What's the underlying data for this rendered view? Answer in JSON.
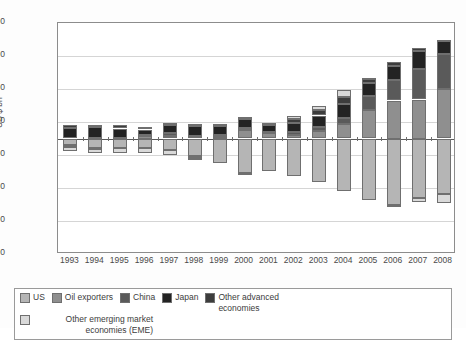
{
  "chart_data": {
    "type": "bar",
    "stacked": true,
    "title": "",
    "xlabel": "",
    "ylabel": "US $ bn",
    "ylim": [
      -1400,
      1400
    ],
    "yticks": [
      1400,
      1000,
      600,
      200,
      -200,
      -600,
      -1000,
      -1400
    ],
    "ytick_labels": [
      "1,400",
      "1,000",
      "600",
      "200",
      "-200",
      "-600",
      "-1,000",
      "-1,400"
    ],
    "grid": true,
    "legend_position": "bottom",
    "categories": [
      "1993",
      "1994",
      "1995",
      "1996",
      "1997",
      "1998",
      "1999",
      "2000",
      "2001",
      "2002",
      "2003",
      "2004",
      "2005",
      "2006",
      "2007",
      "2008"
    ],
    "series": [
      {
        "name": "US",
        "color": "#b5b5b5",
        "values": [
          -82,
          -118,
          -110,
          -120,
          -136,
          -210,
          -297,
          -417,
          -395,
          -459,
          -522,
          -631,
          -749,
          -811,
          -718,
          -673
        ]
      },
      {
        "name": "Oil exporters",
        "color": "#8f8f8f",
        "values": [
          -14,
          -4,
          8,
          36,
          26,
          -25,
          18,
          101,
          62,
          41,
          96,
          181,
          349,
          460,
          473,
          595
        ]
      },
      {
        "name": "China",
        "color": "#5a5a5a",
        "values": [
          -12,
          8,
          2,
          7,
          37,
          31,
          21,
          21,
          17,
          35,
          46,
          69,
          161,
          250,
          372,
          426
        ]
      },
      {
        "name": "Japan",
        "color": "#232323",
        "values": [
          132,
          130,
          111,
          66,
          97,
          119,
          115,
          120,
          88,
          112,
          136,
          172,
          166,
          170,
          211,
          157
        ]
      },
      {
        "name": "Other advanced economies",
        "color": "#3d3d3d",
        "values": [
          38,
          32,
          40,
          29,
          27,
          31,
          13,
          -1,
          19,
          47,
          66,
          77,
          45,
          47,
          46,
          12
        ]
      },
      {
        "name": "Other emerging market economies (EME)",
        "color": "#d9d9d9",
        "values": [
          -49,
          -58,
          -64,
          -59,
          -62,
          -21,
          13,
          25,
          5,
          33,
          54,
          86,
          18,
          -9,
          -58,
          -114
        ]
      }
    ]
  },
  "axis": {
    "y_title": "US $ bn"
  },
  "legend": {
    "items": [
      {
        "label": "US",
        "color": "#b5b5b5"
      },
      {
        "label": "Oil exporters",
        "color": "#8f8f8f"
      },
      {
        "label": "China",
        "color": "#5a5a5a"
      },
      {
        "label": "Japan",
        "color": "#232323"
      },
      {
        "label": "Other advanced economies",
        "color": "#3d3d3d"
      },
      {
        "label": "Other emerging market economies (EME)",
        "color": "#d9d9d9"
      }
    ]
  }
}
